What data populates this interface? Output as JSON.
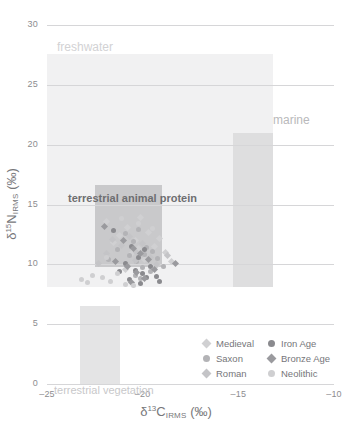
{
  "chart_data": {
    "type": "scatter",
    "title": "",
    "xlabel": "δ¹³C_IRMS (‰)",
    "ylabel": "δ¹⁵N_IRMS (‰)",
    "xlim": [
      -25,
      -10
    ],
    "ylim": [
      0,
      30
    ],
    "xticks": [
      -25,
      -20,
      -15,
      -10
    ],
    "xtick_labels": [
      "–25",
      "–20",
      "–15",
      "–10"
    ],
    "yticks": [
      0,
      5,
      10,
      15,
      20,
      25,
      30
    ],
    "ytick_labels": [
      "0",
      "5",
      "10",
      "15",
      "20",
      "25",
      "30"
    ],
    "grid": "horizontal",
    "legend_position": "lower-right",
    "axis_title_x_parts": {
      "delta": "δ",
      "mass": "13",
      "element": "C",
      "method": "IRMS",
      "units": "(‰)"
    },
    "axis_title_y_parts": {
      "delta": "δ",
      "mass": "15",
      "element": "N",
      "method": "IRMS",
      "units": "(‰)"
    },
    "regions": [
      {
        "name": "freshwater",
        "label": "freshwater",
        "x_range": [
          -25.0,
          -13.2
        ],
        "y_range": [
          8.1,
          27.6
        ],
        "color": "#f1f1f2",
        "label_color": "#d2d2d4"
      },
      {
        "name": "marine",
        "label": "marine",
        "x_range": [
          -15.3,
          -13.2
        ],
        "y_range": [
          8.1,
          21.0
        ],
        "color": "#dededf",
        "label_color": "#b9b9bb"
      },
      {
        "name": "terrestrial-vegetation",
        "label": "terrestrial vegetation",
        "x_range": [
          -23.3,
          -21.2
        ],
        "y_range": [
          0.0,
          6.5
        ],
        "color": "#e4e4e5",
        "label_color": "#c8c8ca"
      },
      {
        "name": "terrestrial-animal-protein",
        "label": "terrestrial animal protein",
        "x_range": [
          -22.5,
          -19.0
        ],
        "y_range": [
          9.8,
          16.6
        ],
        "color": "#c9c9cb",
        "label_color": "#6e6e70"
      }
    ],
    "series": [
      {
        "name": "Medieval",
        "label": "Medieval",
        "marker": "diamond",
        "color": "#d0d0d2",
        "points": [
          [
            -21.9,
            13.6
          ],
          [
            -21.2,
            12.4
          ],
          [
            -20.8,
            13.1
          ],
          [
            -20.4,
            12.0
          ],
          [
            -20.1,
            13.9
          ],
          [
            -19.7,
            12.7
          ],
          [
            -19.4,
            11.5
          ],
          [
            -19.1,
            12.2
          ],
          [
            -20.6,
            10.9
          ],
          [
            -20.2,
            11.3
          ],
          [
            -19.9,
            10.4
          ],
          [
            -21.5,
            11.8
          ],
          [
            -18.8,
            11.0
          ],
          [
            -19.3,
            9.9
          ],
          [
            -20.9,
            9.6
          ],
          [
            -18.5,
            10.2
          ]
        ]
      },
      {
        "name": "Saxon",
        "label": "Saxon",
        "marker": "circle",
        "color": "#b3b3b6",
        "points": [
          [
            -20.9,
            12.6
          ],
          [
            -20.5,
            11.9
          ],
          [
            -20.2,
            12.9
          ],
          [
            -19.8,
            11.4
          ],
          [
            -20.7,
            10.7
          ],
          [
            -20.3,
            10.2
          ],
          [
            -19.9,
            10.8
          ],
          [
            -19.5,
            11.1
          ],
          [
            -21.3,
            11.2
          ],
          [
            -20.0,
            9.7
          ],
          [
            -19.6,
            9.4
          ],
          [
            -20.4,
            9.1
          ],
          [
            -21.8,
            10.4
          ],
          [
            -19.2,
            10.5
          ],
          [
            -18.9,
            9.8
          ],
          [
            -20.1,
            8.8
          ]
        ]
      },
      {
        "name": "Roman",
        "label": "Roman",
        "marker": "diamond",
        "color": "#c4c4c7",
        "points": [
          [
            -21.6,
            12.1
          ],
          [
            -21.1,
            11.6
          ],
          [
            -20.7,
            12.3
          ],
          [
            -20.3,
            11.0
          ],
          [
            -20.0,
            11.7
          ],
          [
            -19.6,
            10.6
          ],
          [
            -21.9,
            10.9
          ],
          [
            -20.8,
            9.9
          ],
          [
            -20.4,
            10.3
          ],
          [
            -19.3,
            10.0
          ],
          [
            -22.3,
            10.1
          ],
          [
            -18.7,
            10.7
          ]
        ]
      },
      {
        "name": "Iron Age",
        "label": "Iron Age",
        "marker": "circle",
        "color": "#8a8a8e",
        "points": [
          [
            -20.6,
            11.5
          ],
          [
            -20.2,
            10.6
          ],
          [
            -19.9,
            11.2
          ],
          [
            -20.9,
            10.1
          ],
          [
            -20.4,
            9.5
          ],
          [
            -20.0,
            9.2
          ],
          [
            -19.6,
            9.8
          ],
          [
            -21.2,
            9.4
          ],
          [
            -19.3,
            9.0
          ],
          [
            -20.7,
            8.7
          ],
          [
            -20.1,
            8.4
          ],
          [
            -19.8,
            8.9
          ],
          [
            -21.5,
            12.8
          ],
          [
            -19.1,
            8.6
          ]
        ]
      },
      {
        "name": "Bronze Age",
        "label": "Bronze Age",
        "marker": "diamond",
        "color": "#9a9a9e",
        "points": [
          [
            -21.0,
            12.0
          ],
          [
            -20.5,
            11.3
          ],
          [
            -20.1,
            10.9
          ],
          [
            -19.7,
            10.4
          ],
          [
            -20.8,
            9.8
          ],
          [
            -20.3,
            9.3
          ],
          [
            -19.9,
            8.8
          ],
          [
            -21.4,
            10.2
          ],
          [
            -19.4,
            9.6
          ],
          [
            -20.6,
            8.5
          ],
          [
            -18.3,
            10.1
          ],
          [
            -22.0,
            13.2
          ]
        ]
      },
      {
        "name": "Neolithic",
        "label": "Neolithic",
        "marker": "circle",
        "color": "#cfcfd1",
        "points": [
          [
            -22.6,
            9.1
          ],
          [
            -23.2,
            8.7
          ],
          [
            -22.1,
            8.9
          ],
          [
            -21.7,
            8.6
          ],
          [
            -21.3,
            9.2
          ],
          [
            -20.9,
            8.3
          ],
          [
            -22.9,
            8.5
          ],
          [
            -20.5,
            8.2
          ],
          [
            -21.9,
            10.6
          ],
          [
            -21.1,
            13.8
          ],
          [
            -20.2,
            13.4
          ],
          [
            -19.5,
            13.0
          ]
        ]
      }
    ]
  }
}
